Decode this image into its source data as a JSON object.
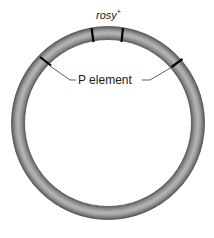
{
  "figure": {
    "type": "plasmid-diagram",
    "labels": {
      "gene": "rosy",
      "gene_superscript": "+",
      "element": "P element"
    },
    "ring": {
      "center": [
        108,
        123
      ],
      "radius": 90,
      "thickness": 12,
      "color_outer": "#6e6e6e",
      "color_mid": "#a8a8a8",
      "color_highlight": "#c9c9c9"
    },
    "markers": [
      {
        "name": "rosy-left-boundary",
        "angle_deg": -100
      },
      {
        "name": "rosy-right-boundary",
        "angle_deg": -80
      },
      {
        "name": "p-element-left-end",
        "angle_deg": -140
      },
      {
        "name": "p-element-right-end",
        "angle_deg": -35
      }
    ],
    "tick_color": "#000000"
  }
}
